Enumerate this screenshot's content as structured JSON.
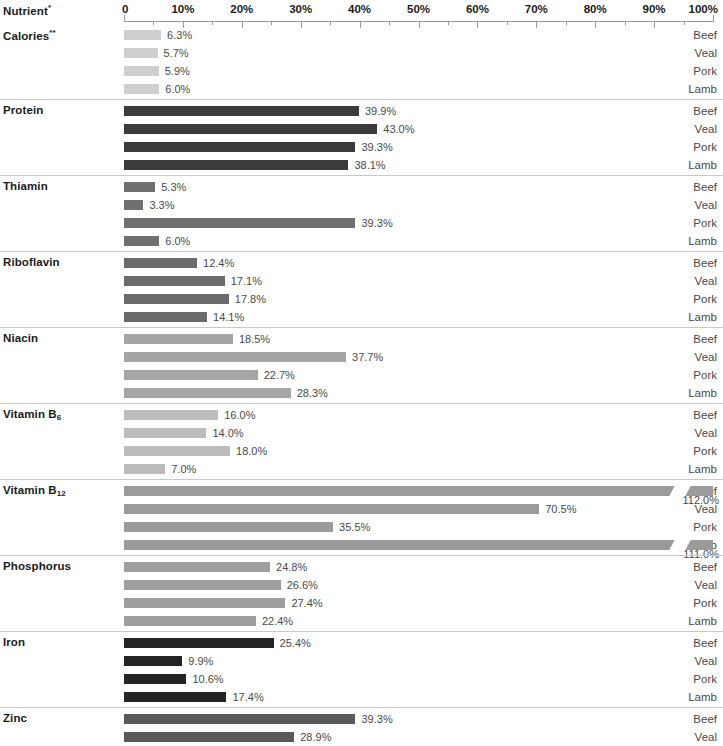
{
  "header": {
    "nutrient_label": "Nutrient",
    "nutrient_asterisk": "*"
  },
  "chart_data": {
    "type": "bar",
    "orientation": "horizontal",
    "title": "Nutrient*",
    "xlabel": "",
    "ylabel": "",
    "xlim": [
      0,
      100
    ],
    "grid": false,
    "legend": "none",
    "axis_ticks": [
      "0",
      "10%",
      "20%",
      "30%",
      "40%",
      "50%",
      "60%",
      "70%",
      "80%",
      "90%",
      "100%"
    ],
    "axis_tick_values": [
      0,
      10,
      20,
      30,
      40,
      50,
      60,
      70,
      80,
      90,
      100
    ],
    "minor_tick_values": [
      5,
      15,
      25,
      35,
      45,
      55,
      65,
      75,
      85,
      95
    ],
    "categories": [
      "Beef",
      "Veal",
      "Pork",
      "Lamb"
    ],
    "groups": [
      {
        "name": "Calories",
        "asterisk": "**",
        "color": "#cfcfcf",
        "values": [
          6.3,
          5.7,
          5.9,
          6.0
        ],
        "labels": [
          "6.3%",
          "5.7%",
          "5.9%",
          "6.0%"
        ]
      },
      {
        "name": "Protein",
        "asterisk": "",
        "color": "#3b3b3b",
        "values": [
          39.9,
          43.0,
          39.3,
          38.1
        ],
        "labels": [
          "39.9%",
          "43.0%",
          "39.3%",
          "38.1%"
        ]
      },
      {
        "name": "Thiamin",
        "asterisk": "",
        "color": "#707070",
        "values": [
          5.3,
          3.3,
          39.3,
          6.0
        ],
        "labels": [
          "5.3%",
          "3.3%",
          "39.3%",
          "6.0%"
        ]
      },
      {
        "name": "Riboflavin",
        "asterisk": "",
        "color": "#6b6b6b",
        "values": [
          12.4,
          17.1,
          17.8,
          14.1
        ],
        "labels": [
          "12.4%",
          "17.1%",
          "17.8%",
          "14.1%"
        ]
      },
      {
        "name": "Niacin",
        "asterisk": "",
        "color": "#a5a5a5",
        "values": [
          18.5,
          37.7,
          22.7,
          28.3
        ],
        "labels": [
          "18.5%",
          "37.7%",
          "22.7%",
          "28.3%"
        ]
      },
      {
        "name": "Vitamin B",
        "subscript": "6",
        "asterisk": "",
        "color": "#bcbcbc",
        "values": [
          16.0,
          14.0,
          18.0,
          7.0
        ],
        "labels": [
          "16.0%",
          "14.0%",
          "18.0%",
          "7.0%"
        ]
      },
      {
        "name": "Vitamin B",
        "subscript": "12",
        "asterisk": "",
        "color": "#9b9b9b",
        "values": [
          112.0,
          70.5,
          35.5,
          111.0
        ],
        "labels": [
          "112.0%",
          "70.5%",
          "35.5%",
          "111.0%"
        ],
        "broken": [
          true,
          false,
          false,
          true
        ],
        "break_at": 93
      },
      {
        "name": "Phosphorus",
        "asterisk": "",
        "color": "#9e9e9e",
        "values": [
          24.8,
          26.6,
          27.4,
          22.4
        ],
        "labels": [
          "24.8%",
          "26.6%",
          "27.4%",
          "22.4%"
        ]
      },
      {
        "name": "Iron",
        "asterisk": "",
        "color": "#242424",
        "values": [
          25.4,
          9.9,
          10.6,
          17.4
        ],
        "labels": [
          "25.4%",
          "9.9%",
          "10.6%",
          "17.4%"
        ]
      },
      {
        "name": "Zinc",
        "asterisk": "",
        "color": "#595959",
        "values": [
          39.3,
          28.9,
          19.7,
          29.9
        ],
        "labels": [
          "39.3%",
          "28.9%",
          "19.7%",
          "29.9%"
        ]
      }
    ]
  }
}
